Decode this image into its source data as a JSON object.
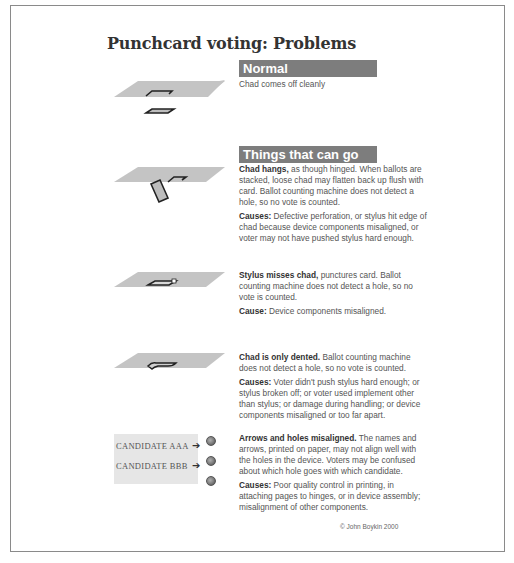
{
  "title": "Punchcard voting: Problems",
  "colors": {
    "header_bar": "#7d7d7d",
    "card": "#c4c4c4",
    "frame": "#8a8a8a"
  },
  "sections": {
    "normal": {
      "heading": "Normal",
      "desc": "Chad comes off cleanly"
    },
    "wrong": {
      "heading": "Things that can go wrong"
    }
  },
  "problems": [
    {
      "id": "chad-hangs",
      "lead": "Chad hangs,",
      "text": " as though hinged. When ballots are stacked, loose chad may flatten back up flush with card. Ballot counting machine does not detect a hole, so no vote is counted.",
      "cause_label": "Causes:",
      "cause_text": " Defective perforation, or stylus hit edge of chad because device components misaligned, or voter may not have pushed stylus hard enough."
    },
    {
      "id": "stylus-misses",
      "lead": "Stylus misses chad,",
      "text": " punctures card. Ballot counting machine does not detect a hole, so no vote is counted.",
      "cause_label": "Cause:",
      "cause_text": " Device components misaligned."
    },
    {
      "id": "chad-dented",
      "lead": "Chad is only dented.",
      "text": " Ballot counting machine does not detect a hole, so no vote is counted.",
      "cause_label": "Causes:",
      "cause_text": " Voter didn't push stylus hard enough; or stylus broken off; or voter used implement other than stylus; or damage during handling; or device components misaligned or too far apart."
    },
    {
      "id": "arrows-misaligned",
      "lead": "Arrows and holes misaligned.",
      "text": " The names and arrows, printed on paper, may not align well with the holes in the device. Voters may be confused about which hole goes with which candidate.",
      "cause_label": "Causes:",
      "cause_text": "  Poor quality control in printing, in attaching pages to hinges, or in device assembly; misalignment of other components."
    }
  ],
  "candidates": [
    {
      "name": "CANDIDATE AAA",
      "arrow": "➔"
    },
    {
      "name": "CANDIDATE BBB",
      "arrow": "➔"
    }
  ],
  "copyright": "© John Boykin 2000"
}
